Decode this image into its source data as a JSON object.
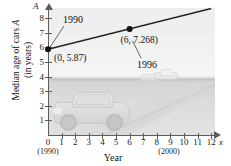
{
  "chart_data": {
    "type": "line",
    "title": "",
    "xlabel": "Year",
    "ylabel": "Median age of cars A (in years)",
    "ylabel_line1": "Median age of cars",
    "ylabel_var": "A",
    "ylabel_line2": "(in years)",
    "x_axis_variable": "x",
    "y_axis_variable": "A",
    "xlim": [
      0,
      12
    ],
    "ylim": [
      0,
      8.8
    ],
    "x_ticks": [
      "0",
      "1",
      "2",
      "3",
      "4",
      "5",
      "6",
      "7",
      "8",
      "9",
      "10",
      "11",
      "12"
    ],
    "y_ticks": [
      "1",
      "2",
      "3",
      "4",
      "5",
      "6",
      "7",
      "8"
    ],
    "x_tick_notes": [
      {
        "tick": "0",
        "note": "(1990)"
      },
      {
        "tick": "10",
        "note": "(2000)"
      }
    ],
    "grid": false,
    "legend": "none",
    "series": [
      {
        "name": "Median age of cars",
        "points": [
          {
            "x": 0,
            "y": 5.87,
            "label": "(0, 5.87)",
            "annotation": "1990"
          },
          {
            "x": 6,
            "y": 7.268,
            "label": "(6, 7.268)",
            "annotation": "1996"
          }
        ],
        "line_extends_to_x": 12,
        "color": "#262626"
      }
    ],
    "annotations": [
      {
        "text": "1990",
        "points_to": "(0, 5.87)"
      },
      {
        "text": "(0, 5.87)",
        "points_to": "data-point-0"
      },
      {
        "text": "(6, 7.268)",
        "points_to": "data-point-1"
      },
      {
        "text": "1996",
        "points_to": "(6, 7.268)"
      }
    ],
    "background_image": "photo of car on highway"
  },
  "labels": {
    "y_axis_var": "A",
    "x_axis_var": "x",
    "y_title_main": "Median age of cars",
    "y_title_var": "A",
    "y_title_unit": "(in years)",
    "x_title": "Year",
    "note_1990": "(1990)",
    "note_2000": "(2000)",
    "ann_1990": "1990",
    "ann_1996": "1996",
    "pt1_label": "(0, 5.87)",
    "pt2_label": "(6, 7.268)"
  },
  "y_ticks": [
    {
      "v": "8"
    },
    {
      "v": "7"
    },
    {
      "v": "6"
    },
    {
      "v": "5"
    },
    {
      "v": "4"
    },
    {
      "v": "3"
    },
    {
      "v": "2"
    },
    {
      "v": "1"
    }
  ],
  "x_ticks": [
    {
      "v": "0"
    },
    {
      "v": "1"
    },
    {
      "v": "2"
    },
    {
      "v": "3"
    },
    {
      "v": "4"
    },
    {
      "v": "5"
    },
    {
      "v": "6"
    },
    {
      "v": "7"
    },
    {
      "v": "8"
    },
    {
      "v": "9"
    },
    {
      "v": "10"
    },
    {
      "v": "11"
    },
    {
      "v": "12"
    }
  ]
}
